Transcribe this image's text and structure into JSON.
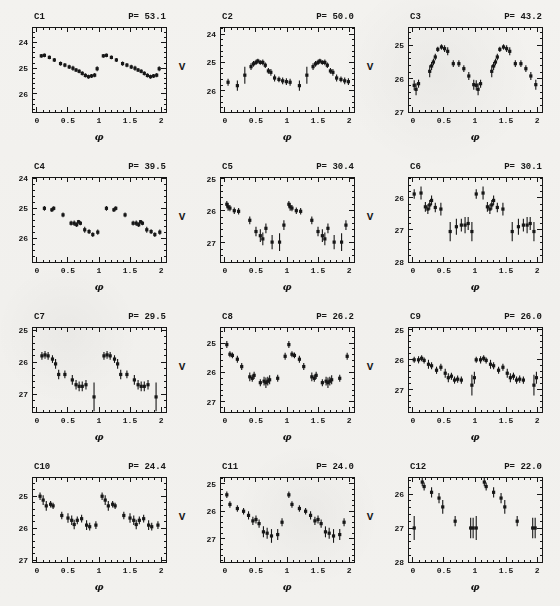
{
  "figure": {
    "ylabel": "V",
    "xlabel": "φ",
    "ink_color": "#1c1c1c",
    "paper_color": "#f2f1ee"
  },
  "chart_data": [
    {
      "type": "scatter",
      "id": "C1",
      "period_label": "P= 53.1",
      "xlabel": "φ",
      "ylabel": "",
      "xlim": [
        -0.08,
        2.08
      ],
      "xticks": [
        0,
        0.5,
        1,
        1.5,
        2
      ],
      "xtick_labels": [
        "0",
        "0.5",
        "1",
        "1.5",
        "2"
      ],
      "ylim": [
        23.4,
        26.7
      ],
      "yticks": [
        24,
        25,
        26
      ],
      "x_minor_step": 0.1,
      "y_minor_step": 0.2,
      "duplicate_cycle": true,
      "points_phase_mag_err": [
        [
          0.07,
          24.52,
          0.07
        ],
        [
          0.12,
          24.5,
          0.07
        ],
        [
          0.2,
          24.58,
          0.07
        ],
        [
          0.28,
          24.68,
          0.08
        ],
        [
          0.38,
          24.82,
          0.08
        ],
        [
          0.45,
          24.88,
          0.08
        ],
        [
          0.52,
          24.95,
          0.08
        ],
        [
          0.58,
          25.0,
          0.1
        ],
        [
          0.63,
          25.07,
          0.08
        ],
        [
          0.68,
          25.12,
          0.08
        ],
        [
          0.73,
          25.2,
          0.08
        ],
        [
          0.78,
          25.28,
          0.08
        ],
        [
          0.83,
          25.33,
          0.08
        ],
        [
          0.88,
          25.3,
          0.08
        ],
        [
          0.93,
          25.27,
          0.08
        ],
        [
          0.97,
          25.02,
          0.1
        ]
      ]
    },
    {
      "type": "scatter",
      "id": "C2",
      "period_label": "P= 50.0",
      "xlabel": "φ",
      "ylabel": "V",
      "xlim": [
        -0.08,
        2.08
      ],
      "xticks": [
        0,
        0.5,
        1,
        1.5,
        2
      ],
      "xtick_labels": [
        "0",
        "0.5",
        "1",
        "1.5",
        "2"
      ],
      "ylim": [
        23.75,
        26.75
      ],
      "yticks": [
        24,
        25,
        26
      ],
      "x_minor_step": 0.1,
      "y_minor_step": 0.2,
      "duplicate_cycle": true,
      "points_phase_mag_err": [
        [
          0.05,
          25.7,
          0.12
        ],
        [
          0.2,
          25.82,
          0.18
        ],
        [
          0.32,
          25.45,
          0.3
        ],
        [
          0.42,
          25.15,
          0.12
        ],
        [
          0.46,
          25.05,
          0.1
        ],
        [
          0.5,
          25.0,
          0.09
        ],
        [
          0.53,
          24.95,
          0.08
        ],
        [
          0.57,
          25.0,
          0.08
        ],
        [
          0.61,
          25.0,
          0.1
        ],
        [
          0.65,
          25.1,
          0.1
        ],
        [
          0.7,
          25.3,
          0.1
        ],
        [
          0.74,
          25.35,
          0.12
        ],
        [
          0.8,
          25.55,
          0.12
        ],
        [
          0.87,
          25.6,
          0.1
        ],
        [
          0.93,
          25.65,
          0.12
        ],
        [
          0.99,
          25.68,
          0.12
        ]
      ]
    },
    {
      "type": "scatter",
      "id": "C3",
      "period_label": "P= 43.2",
      "xlabel": "φ",
      "ylabel": "V",
      "xlim": [
        -0.08,
        2.08
      ],
      "xticks": [
        0,
        0.5,
        1,
        1.5,
        2
      ],
      "xtick_labels": [
        "0",
        "0.5",
        "1",
        "1.5",
        "2"
      ],
      "ylim": [
        24.45,
        27.0
      ],
      "yticks": [
        25,
        26,
        27
      ],
      "x_minor_step": 0.1,
      "y_minor_step": 0.2,
      "duplicate_cycle": true,
      "points_phase_mag_err": [
        [
          0.02,
          26.2,
          0.15
        ],
        [
          0.05,
          26.32,
          0.18
        ],
        [
          0.09,
          26.15,
          0.12
        ],
        [
          0.27,
          25.78,
          0.18
        ],
        [
          0.3,
          25.62,
          0.12
        ],
        [
          0.33,
          25.5,
          0.1
        ],
        [
          0.36,
          25.35,
          0.1
        ],
        [
          0.4,
          25.12,
          0.08
        ],
        [
          0.46,
          25.05,
          0.08
        ],
        [
          0.51,
          25.1,
          0.1
        ],
        [
          0.56,
          25.18,
          0.12
        ],
        [
          0.65,
          25.55,
          0.1
        ],
        [
          0.74,
          25.55,
          0.1
        ],
        [
          0.82,
          25.7,
          0.1
        ],
        [
          0.9,
          25.92,
          0.12
        ],
        [
          0.98,
          26.18,
          0.15
        ]
      ]
    },
    {
      "type": "scatter",
      "id": "C4",
      "period_label": "P= 39.5",
      "xlabel": "φ",
      "ylabel": "",
      "xlim": [
        -0.08,
        2.08
      ],
      "xticks": [
        0,
        0.5,
        1,
        1.5,
        2
      ],
      "xtick_labels": [
        "0",
        "0.5",
        "1",
        "1.5",
        "2"
      ],
      "ylim": [
        23.95,
        26.8
      ],
      "yticks": [
        24,
        25,
        26
      ],
      "x_minor_step": 0.1,
      "y_minor_step": 0.2,
      "duplicate_cycle": true,
      "points_phase_mag_err": [
        [
          0.12,
          25.0,
          0.08
        ],
        [
          0.24,
          25.05,
          0.07
        ],
        [
          0.27,
          25.0,
          0.07
        ],
        [
          0.42,
          25.22,
          0.08
        ],
        [
          0.55,
          25.5,
          0.08
        ],
        [
          0.6,
          25.5,
          0.09
        ],
        [
          0.64,
          25.55,
          0.08
        ],
        [
          0.67,
          25.45,
          0.06
        ],
        [
          0.7,
          25.5,
          0.07
        ],
        [
          0.77,
          25.72,
          0.1
        ],
        [
          0.84,
          25.78,
          0.08
        ],
        [
          0.9,
          25.88,
          0.08
        ],
        [
          0.98,
          25.8,
          0.09
        ]
      ]
    },
    {
      "type": "scatter",
      "id": "C5",
      "period_label": "P= 30.4",
      "xlabel": "φ",
      "ylabel": "V",
      "xlim": [
        -0.08,
        2.08
      ],
      "xticks": [
        0,
        0.5,
        1,
        1.5,
        2
      ],
      "xtick_labels": [
        "0",
        "0.5",
        "1",
        "1.5",
        "2"
      ],
      "ylim": [
        24.95,
        27.6
      ],
      "yticks": [
        25,
        26,
        27
      ],
      "x_minor_step": 0.1,
      "y_minor_step": 0.2,
      "duplicate_cycle": true,
      "points_phase_mag_err": [
        [
          0.03,
          25.8,
          0.1
        ],
        [
          0.05,
          25.88,
          0.12
        ],
        [
          0.08,
          25.92,
          0.1
        ],
        [
          0.15,
          26.0,
          0.1
        ],
        [
          0.22,
          26.02,
          0.1
        ],
        [
          0.4,
          26.3,
          0.12
        ],
        [
          0.5,
          26.65,
          0.15
        ],
        [
          0.57,
          26.78,
          0.2
        ],
        [
          0.61,
          26.88,
          0.2
        ],
        [
          0.66,
          26.55,
          0.15
        ],
        [
          0.76,
          26.98,
          0.22
        ],
        [
          0.88,
          26.98,
          0.28
        ],
        [
          0.95,
          26.45,
          0.15
        ]
      ]
    },
    {
      "type": "scatter",
      "id": "C6",
      "period_label": "P= 30.1",
      "xlabel": "φ",
      "ylabel": "V",
      "xlim": [
        -0.08,
        2.08
      ],
      "xticks": [
        0,
        0.5,
        1,
        1.5,
        2
      ],
      "xtick_labels": [
        "0",
        "0.5",
        "1",
        "1.5",
        "2"
      ],
      "ylim": [
        25.35,
        28.0
      ],
      "yticks": [
        26,
        27,
        28
      ],
      "x_minor_step": 0.1,
      "y_minor_step": 0.2,
      "duplicate_cycle": true,
      "points_phase_mag_err": [
        [
          0.02,
          25.88,
          0.15
        ],
        [
          0.13,
          25.85,
          0.2
        ],
        [
          0.2,
          26.28,
          0.15
        ],
        [
          0.24,
          26.35,
          0.15
        ],
        [
          0.27,
          26.22,
          0.15
        ],
        [
          0.3,
          26.08,
          0.15
        ],
        [
          0.36,
          26.3,
          0.15
        ],
        [
          0.45,
          26.35,
          0.2
        ],
        [
          0.6,
          27.05,
          0.3
        ],
        [
          0.7,
          26.9,
          0.25
        ],
        [
          0.78,
          26.85,
          0.2
        ],
        [
          0.84,
          26.85,
          0.25
        ],
        [
          0.89,
          26.8,
          0.2
        ],
        [
          0.95,
          27.05,
          0.3
        ]
      ]
    },
    {
      "type": "scatter",
      "id": "C7",
      "period_label": "P= 29.5",
      "xlabel": "φ",
      "ylabel": "",
      "xlim": [
        -0.08,
        2.08
      ],
      "xticks": [
        0,
        0.5,
        1,
        1.5,
        2
      ],
      "xtick_labels": [
        "0",
        "0.5",
        "1",
        "1.5",
        "2"
      ],
      "ylim": [
        24.9,
        27.55
      ],
      "yticks": [
        25,
        26,
        27
      ],
      "x_minor_step": 0.1,
      "y_minor_step": 0.2,
      "duplicate_cycle": true,
      "points_phase_mag_err": [
        [
          0.08,
          25.8,
          0.12
        ],
        [
          0.13,
          25.77,
          0.12
        ],
        [
          0.18,
          25.8,
          0.12
        ],
        [
          0.25,
          25.9,
          0.12
        ],
        [
          0.3,
          26.05,
          0.15
        ],
        [
          0.35,
          26.38,
          0.15
        ],
        [
          0.45,
          26.38,
          0.12
        ],
        [
          0.57,
          26.55,
          0.15
        ],
        [
          0.63,
          26.7,
          0.15
        ],
        [
          0.68,
          26.75,
          0.15
        ],
        [
          0.73,
          26.75,
          0.15
        ],
        [
          0.79,
          26.7,
          0.15
        ],
        [
          0.92,
          27.08,
          0.45
        ]
      ]
    },
    {
      "type": "scatter",
      "id": "C8",
      "period_label": "P= 26.2",
      "xlabel": "φ",
      "ylabel": "V",
      "xlim": [
        -0.08,
        2.08
      ],
      "xticks": [
        0,
        0.5,
        1,
        1.5,
        2
      ],
      "xtick_labels": [
        "0",
        "0.5",
        "1",
        "1.5",
        "2"
      ],
      "ylim": [
        24.45,
        27.35
      ],
      "yticks": [
        25,
        26,
        27
      ],
      "x_minor_step": 0.1,
      "y_minor_step": 0.2,
      "duplicate_cycle": true,
      "points_phase_mag_err": [
        [
          0.03,
          25.05,
          0.12
        ],
        [
          0.08,
          25.38,
          0.1
        ],
        [
          0.12,
          25.42,
          0.1
        ],
        [
          0.2,
          25.55,
          0.12
        ],
        [
          0.27,
          25.8,
          0.12
        ],
        [
          0.4,
          26.15,
          0.15
        ],
        [
          0.44,
          26.2,
          0.12
        ],
        [
          0.47,
          26.1,
          0.12
        ],
        [
          0.57,
          26.35,
          0.12
        ],
        [
          0.63,
          26.3,
          0.15
        ],
        [
          0.66,
          26.35,
          0.18
        ],
        [
          0.69,
          26.3,
          0.15
        ],
        [
          0.72,
          26.25,
          0.15
        ],
        [
          0.85,
          26.2,
          0.12
        ],
        [
          0.97,
          25.45,
          0.12
        ]
      ]
    },
    {
      "type": "scatter",
      "id": "C9",
      "period_label": "P= 26.0",
      "xlabel": "φ",
      "ylabel": "V",
      "xlim": [
        -0.08,
        2.08
      ],
      "xticks": [
        0,
        0.5,
        1,
        1.5,
        2
      ],
      "xtick_labels": [
        "0",
        "0.5",
        "1",
        "1.5",
        "2"
      ],
      "ylim": [
        24.9,
        27.75
      ],
      "yticks": [
        25,
        26,
        27
      ],
      "x_minor_step": 0.1,
      "y_minor_step": 0.2,
      "duplicate_cycle": true,
      "points_phase_mag_err": [
        [
          0.02,
          26.0,
          0.1
        ],
        [
          0.09,
          26.0,
          0.12
        ],
        [
          0.14,
          25.95,
          0.1
        ],
        [
          0.18,
          26.02,
          0.1
        ],
        [
          0.25,
          26.15,
          0.15
        ],
        [
          0.3,
          26.2,
          0.12
        ],
        [
          0.38,
          26.35,
          0.12
        ],
        [
          0.45,
          26.25,
          0.12
        ],
        [
          0.52,
          26.45,
          0.15
        ],
        [
          0.57,
          26.6,
          0.15
        ],
        [
          0.62,
          26.55,
          0.12
        ],
        [
          0.67,
          26.68,
          0.12
        ],
        [
          0.72,
          26.65,
          0.12
        ],
        [
          0.78,
          26.68,
          0.12
        ],
        [
          0.95,
          26.85,
          0.35
        ],
        [
          0.99,
          26.6,
          0.2
        ]
      ]
    },
    {
      "type": "scatter",
      "id": "C10",
      "period_label": "P= 24.4",
      "xlabel": "φ",
      "ylabel": "",
      "xlim": [
        -0.08,
        2.08
      ],
      "xticks": [
        0,
        0.5,
        1,
        1.5,
        2
      ],
      "xtick_labels": [
        "0",
        "0.5",
        "1",
        "1.5",
        "2"
      ],
      "ylim": [
        24.4,
        27.05
      ],
      "yticks": [
        25,
        26,
        27
      ],
      "x_minor_step": 0.1,
      "y_minor_step": 0.2,
      "duplicate_cycle": true,
      "points_phase_mag_err": [
        [
          0.05,
          25.0,
          0.12
        ],
        [
          0.1,
          25.12,
          0.15
        ],
        [
          0.15,
          25.3,
          0.15
        ],
        [
          0.22,
          25.25,
          0.1
        ],
        [
          0.26,
          25.3,
          0.1
        ],
        [
          0.4,
          25.6,
          0.12
        ],
        [
          0.5,
          25.68,
          0.15
        ],
        [
          0.56,
          25.75,
          0.15
        ],
        [
          0.6,
          25.88,
          0.15
        ],
        [
          0.65,
          25.75,
          0.12
        ],
        [
          0.72,
          25.7,
          0.12
        ],
        [
          0.8,
          25.9,
          0.15
        ],
        [
          0.85,
          25.95,
          0.12
        ],
        [
          0.95,
          25.9,
          0.12
        ]
      ]
    },
    {
      "type": "scatter",
      "id": "C11",
      "period_label": "P= 24.0",
      "xlabel": "φ",
      "ylabel": "V",
      "xlim": [
        -0.08,
        2.08
      ],
      "xticks": [
        0,
        0.5,
        1,
        1.5,
        2
      ],
      "xtick_labels": [
        "0",
        "0.5",
        "1",
        "1.5",
        "2"
      ],
      "ylim": [
        24.75,
        27.85
      ],
      "yticks": [
        25,
        26,
        27
      ],
      "x_minor_step": 0.1,
      "y_minor_step": 0.2,
      "duplicate_cycle": true,
      "points_phase_mag_err": [
        [
          0.03,
          25.4,
          0.12
        ],
        [
          0.08,
          25.75,
          0.12
        ],
        [
          0.2,
          25.9,
          0.12
        ],
        [
          0.3,
          26.0,
          0.12
        ],
        [
          0.38,
          26.15,
          0.15
        ],
        [
          0.45,
          26.35,
          0.15
        ],
        [
          0.5,
          26.3,
          0.15
        ],
        [
          0.55,
          26.45,
          0.15
        ],
        [
          0.62,
          26.75,
          0.2
        ],
        [
          0.68,
          26.8,
          0.2
        ],
        [
          0.75,
          26.9,
          0.25
        ],
        [
          0.85,
          26.85,
          0.2
        ],
        [
          0.92,
          26.4,
          0.15
        ]
      ]
    },
    {
      "type": "scatter",
      "id": "C12",
      "period_label": "P= 22.0",
      "xlabel": "φ",
      "ylabel": "V",
      "xlim": [
        -0.08,
        2.08
      ],
      "xticks": [
        0,
        0.5,
        1,
        1.5,
        2
      ],
      "xtick_labels": [
        "0",
        "0.5",
        "1",
        "1.5",
        "2"
      ],
      "ylim": [
        25.5,
        28.0
      ],
      "yticks": [
        26,
        27,
        28
      ],
      "x_minor_step": 0.1,
      "y_minor_step": 0.2,
      "duplicate_cycle": true,
      "points_phase_mag_err": [
        [
          0.02,
          27.0,
          0.35
        ],
        [
          0.15,
          25.65,
          0.12
        ],
        [
          0.18,
          25.78,
          0.12
        ],
        [
          0.3,
          25.95,
          0.15
        ],
        [
          0.42,
          26.12,
          0.15
        ],
        [
          0.48,
          26.38,
          0.2
        ],
        [
          0.68,
          26.8,
          0.15
        ],
        [
          0.93,
          27.0,
          0.3
        ],
        [
          0.97,
          27.0,
          0.3
        ]
      ]
    }
  ]
}
